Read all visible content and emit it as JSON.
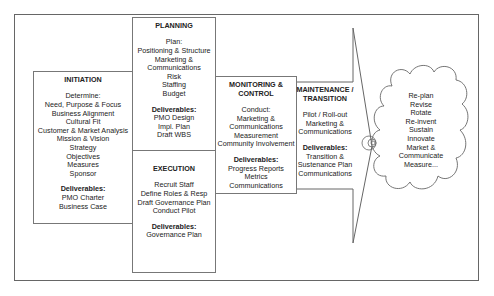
{
  "diagram": {
    "phases": [
      {
        "id": "initiation",
        "title": "INITIATION",
        "lines": [
          "Determine:",
          "Need, Purpose & Focus",
          "Business Alignment",
          "Cultural Fit",
          "Customer & Market Analysis",
          "Mission & Vision",
          "Strategy",
          "Objectives",
          "Measures",
          "Sponsor"
        ],
        "deliverables_label": "Deliverables:",
        "deliverables": [
          "PMO Charter",
          "Business Case"
        ]
      },
      {
        "id": "planning",
        "title": "PLANNING",
        "lines": [
          "Plan:",
          "Positioning & Structure",
          "Marketing &",
          "Communications",
          "Risk",
          "Staffing",
          "Budget"
        ],
        "deliverables_label": "Deliverables:",
        "deliverables": [
          "PMO Design",
          "Impl. Plan",
          "Draft WBS"
        ]
      },
      {
        "id": "execution",
        "title": "EXECUTION",
        "lines": [
          "Recruit Staff",
          "Define Roles & Resp",
          "Draft Governance Plan",
          "Conduct Pilot"
        ],
        "deliverables_label": "Deliverables:",
        "deliverables": [
          "Governance Plan"
        ]
      },
      {
        "id": "monitoring",
        "title": "MONITORING &",
        "title2": "CONTROL",
        "lines": [
          "Conduct:",
          "Marketing &",
          "Communications",
          "Measurement",
          "Community Involvement"
        ],
        "deliverables_label": "Deliverables:",
        "deliverables": [
          "Progress Reports",
          "Metrics",
          "Communications"
        ]
      },
      {
        "id": "maintenance",
        "title": "MAINTENANCE /",
        "title2": "TRANSITION",
        "lines": [
          "Pilot / Roll-out",
          "Marketing &",
          "Communications"
        ],
        "deliverables_label": "Deliverables:",
        "deliverables": [
          "Transition &",
          "Sustenance Plan",
          "Communications"
        ]
      }
    ],
    "cloud": {
      "lines": [
        "Re-plan",
        "Revise",
        "Rotate",
        "Re-invent",
        "Sustain",
        "Innovate",
        "Market &",
        "Communicate",
        "Measure..."
      ]
    },
    "colors": {
      "border": "#777777",
      "text": "#222222",
      "background": "#ffffff"
    }
  }
}
